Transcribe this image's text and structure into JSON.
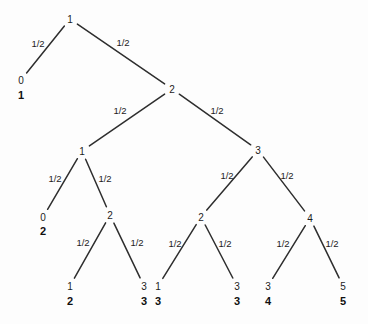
{
  "figure": {
    "kind": "binary-probability-tree-diagram",
    "width": 368,
    "height": 324,
    "background_color": "#fdfdfd",
    "line_color": "#2e2e2e",
    "text_color": "#1c1c1c",
    "edge_probability": "1/2"
  },
  "tree": {
    "nodes": [
      {
        "id": "root",
        "label": "1",
        "x": 70,
        "y": 19,
        "bold_value": null,
        "bold_y": null
      },
      {
        "id": "n-l1a",
        "label": "0",
        "x": 21,
        "y": 80,
        "bold_value": "1",
        "bold_y": 95
      },
      {
        "id": "n-l1b",
        "label": "2",
        "x": 172,
        "y": 89,
        "bold_value": null,
        "bold_y": null
      },
      {
        "id": "n-l2a",
        "label": "1",
        "x": 82,
        "y": 151,
        "bold_value": null,
        "bold_y": null
      },
      {
        "id": "n-l2b",
        "label": "3",
        "x": 258,
        "y": 150,
        "bold_value": null,
        "bold_y": null
      },
      {
        "id": "n-l3a",
        "label": "0",
        "x": 43,
        "y": 217,
        "bold_value": "2",
        "bold_y": 231
      },
      {
        "id": "n-l3b",
        "label": "2",
        "x": 110,
        "y": 215,
        "bold_value": null,
        "bold_y": null
      },
      {
        "id": "n-l3c",
        "label": "2",
        "x": 201,
        "y": 217,
        "bold_value": null,
        "bold_y": null
      },
      {
        "id": "n-l3d",
        "label": "4",
        "x": 310,
        "y": 218,
        "bold_value": null,
        "bold_y": null
      },
      {
        "id": "n-l4a",
        "label": "1",
        "x": 70,
        "y": 286,
        "bold_value": "2",
        "bold_y": 301
      },
      {
        "id": "n-l4b",
        "label": "3",
        "x": 144,
        "y": 286,
        "bold_value": "3",
        "bold_y": 301
      },
      {
        "id": "n-l4c",
        "label": "1",
        "x": 158,
        "y": 286,
        "bold_value": "3",
        "bold_y": 301
      },
      {
        "id": "n-l4d",
        "label": "3",
        "x": 237,
        "y": 286,
        "bold_value": "3",
        "bold_y": 301
      },
      {
        "id": "n-l4e",
        "label": "3",
        "x": 268,
        "y": 286,
        "bold_value": "4",
        "bold_y": 301
      },
      {
        "id": "n-l4f",
        "label": "5",
        "x": 343,
        "y": 286,
        "bold_value": "5",
        "bold_y": 301
      }
    ],
    "edges": [
      {
        "from": "root",
        "to": "n-l1a",
        "label": "1/2",
        "label_x": 38,
        "label_y": 43
      },
      {
        "from": "root",
        "to": "n-l1b",
        "label": "1/2",
        "label_x": 123,
        "label_y": 42
      },
      {
        "from": "n-l1b",
        "to": "n-l2a",
        "label": "1/2",
        "label_x": 120,
        "label_y": 110
      },
      {
        "from": "n-l1b",
        "to": "n-l2b",
        "label": "1/2",
        "label_x": 217,
        "label_y": 110
      },
      {
        "from": "n-l2a",
        "to": "n-l3a",
        "label": "1/2",
        "label_x": 55,
        "label_y": 178
      },
      {
        "from": "n-l2a",
        "to": "n-l3b",
        "label": "1/2",
        "label_x": 105,
        "label_y": 178
      },
      {
        "from": "n-l2b",
        "to": "n-l3c",
        "label": "1/2",
        "label_x": 227,
        "label_y": 175
      },
      {
        "from": "n-l2b",
        "to": "n-l3d",
        "label": "1/2",
        "label_x": 287,
        "label_y": 175
      },
      {
        "from": "n-l3b",
        "to": "n-l4a",
        "label": "1/2",
        "label_x": 83,
        "label_y": 242
      },
      {
        "from": "n-l3b",
        "to": "n-l4b",
        "label": "1/2",
        "label_x": 137,
        "label_y": 242
      },
      {
        "from": "n-l3c",
        "to": "n-l4c",
        "label": "1/2",
        "label_x": 175,
        "label_y": 243
      },
      {
        "from": "n-l3c",
        "to": "n-l4d",
        "label": "1/2",
        "label_x": 225,
        "label_y": 243
      },
      {
        "from": "n-l3d",
        "to": "n-l4e",
        "label": "1/2",
        "label_x": 283,
        "label_y": 243
      },
      {
        "from": "n-l3d",
        "to": "n-l4f",
        "label": "1/2",
        "label_x": 332,
        "label_y": 243
      }
    ]
  }
}
